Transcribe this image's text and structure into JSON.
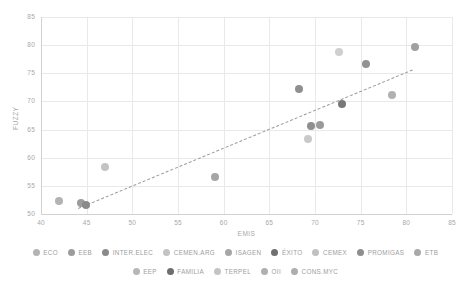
{
  "chart_data": {
    "type": "scatter",
    "title": "",
    "xlabel": "EMIS",
    "ylabel": "FUZZY",
    "xlim": [
      40,
      85
    ],
    "ylim": [
      50,
      85
    ],
    "xticks": [
      "40",
      "45",
      "50",
      "55",
      "60",
      "65",
      "70",
      "75",
      "80",
      "85"
    ],
    "yticks": [
      "50",
      "55",
      "60",
      "65",
      "70",
      "75",
      "80",
      "85"
    ],
    "grid": true,
    "legend_position": "bottom",
    "points": [
      {
        "label": "ECO",
        "x": 42.0,
        "y": 52.3,
        "color": "#b3b3b3",
        "size": 8
      },
      {
        "label": "EEB",
        "x": 44.4,
        "y": 51.9,
        "color": "#9c9c9c",
        "size": 8
      },
      {
        "label": "INTER.ELEC",
        "x": 44.9,
        "y": 51.6,
        "color": "#8a8a8a",
        "size": 8
      },
      {
        "label": "CEMEN.ARG",
        "x": 47.0,
        "y": 58.3,
        "color": "#c3c3c3",
        "size": 8
      },
      {
        "label": "ISAGEN",
        "x": 59.0,
        "y": 56.6,
        "color": "#a6a6a6",
        "size": 8
      },
      {
        "label": "ÉXITO",
        "x": 68.3,
        "y": 72.2,
        "color": "#8f8f8f",
        "size": 8
      },
      {
        "label": "CEMEX",
        "x": 69.2,
        "y": 63.4,
        "color": "#c9c9c9",
        "size": 8
      },
      {
        "label": "PROMIGAS",
        "x": 69.6,
        "y": 65.6,
        "color": "#8e8e8e",
        "size": 8
      },
      {
        "label": "ETB",
        "x": 70.6,
        "y": 65.8,
        "color": "#9a9a9a",
        "size": 8
      },
      {
        "label": "EEP",
        "x": 72.6,
        "y": 78.8,
        "color": "#cfcfcf",
        "size": 8
      },
      {
        "label": "FAMILIA",
        "x": 73.0,
        "y": 69.6,
        "color": "#787878",
        "size": 8
      },
      {
        "label": "TERPEL",
        "x": 75.6,
        "y": 76.6,
        "color": "#929292",
        "size": 8
      },
      {
        "label": "OII",
        "x": 78.4,
        "y": 71.2,
        "color": "#b0b0b0",
        "size": 8
      },
      {
        "label": "CONS.MYC",
        "x": 81.0,
        "y": 79.7,
        "color": "#a0a0a0",
        "size": 8
      }
    ],
    "trendline": {
      "type": "dashed-linear",
      "x0": 44.0,
      "y0": 51.0,
      "x1": 80.6,
      "y1": 75.6,
      "color": "#9b9b9b"
    }
  },
  "legend": {
    "rows": [
      [
        {
          "label": "ECO",
          "color": "#b3b3b3"
        },
        {
          "label": "EEB",
          "color": "#9c9c9c"
        },
        {
          "label": "INTER.ELEC",
          "color": "#8a8a8a"
        },
        {
          "label": "CEMEN.ARG",
          "color": "#c3c3c3"
        },
        {
          "label": "ISAGEN",
          "color": "#a6a6a6"
        },
        {
          "label": "ÉXITO",
          "color": "#6f6f6f"
        },
        {
          "label": "CEMEX",
          "color": "#c0c0c0"
        },
        {
          "label": "PROMIGAS",
          "color": "#8e8e8e"
        },
        {
          "label": "ETB",
          "color": "#a9a9a9"
        }
      ],
      [
        {
          "label": "EEP",
          "color": "#b6b6b6"
        },
        {
          "label": "FAMILIA",
          "color": "#6e6e6e"
        },
        {
          "label": "TERPEL",
          "color": "#c4c4c4"
        },
        {
          "label": "OII",
          "color": "#b0b0b0"
        },
        {
          "label": "CONS.MYC",
          "color": "#adadad"
        }
      ]
    ]
  }
}
